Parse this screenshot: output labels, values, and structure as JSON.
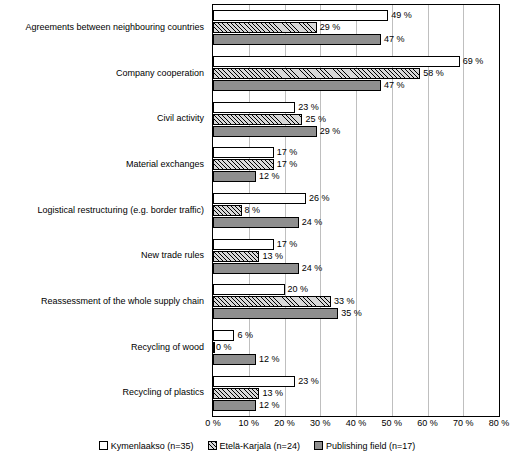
{
  "chart_data": {
    "type": "bar",
    "orientation": "horizontal",
    "title": "",
    "xlabel": "",
    "ylabel": "",
    "xlim": [
      0,
      80
    ],
    "xticks": [
      "0 %",
      "10 %",
      "20 %",
      "30 %",
      "40 %",
      "50 %",
      "60 %",
      "70 %",
      "80 %"
    ],
    "grid": true,
    "legend_position": "bottom",
    "categories": [
      "Agreements between neighbouring countries",
      "Company cooperation",
      "Civil activity",
      "Material exchanges",
      "Logistical restructuring (e.g. border traffic)",
      "New trade rules",
      "Reassessment of the whole supply chain",
      "Recycling of wood",
      "Recycling of plastics"
    ],
    "series": [
      {
        "name": "Kymenlaakso (n=35)",
        "values": [
          49,
          69,
          23,
          17,
          26,
          17,
          20,
          6,
          23
        ],
        "labels": [
          "49 %",
          "69 %",
          "23 %",
          "17 %",
          "26 %",
          "17 %",
          "20 %",
          "6 %",
          "23 %"
        ]
      },
      {
        "name": "Etelä-Karjala (n=24)",
        "values": [
          29,
          58,
          25,
          17,
          8,
          13,
          33,
          0,
          13
        ],
        "labels": [
          "29 %",
          "58 %",
          "25 %",
          "17 %",
          "8 %",
          "13 %",
          "33 %",
          "0 %",
          "13 %"
        ]
      },
      {
        "name": "Publishing field (n=17)",
        "values": [
          47,
          47,
          29,
          12,
          24,
          24,
          35,
          12,
          12
        ],
        "labels": [
          "47 %",
          "47 %",
          "29 %",
          "12 %",
          "24 %",
          "24 %",
          "35 %",
          "12 %",
          "12 %"
        ]
      }
    ]
  }
}
